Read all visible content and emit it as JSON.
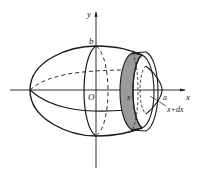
{
  "figure": {
    "labels": {
      "y_axis": "y",
      "x_axis": "x",
      "origin": "O",
      "semi_minor": "b",
      "semi_major": "a",
      "slice_left": "x",
      "slice_right": "x+dx"
    },
    "colors": {
      "stroke": "#1a1a1a",
      "slice_fill": "#9a9a9a",
      "background": "#ffffff"
    }
  }
}
